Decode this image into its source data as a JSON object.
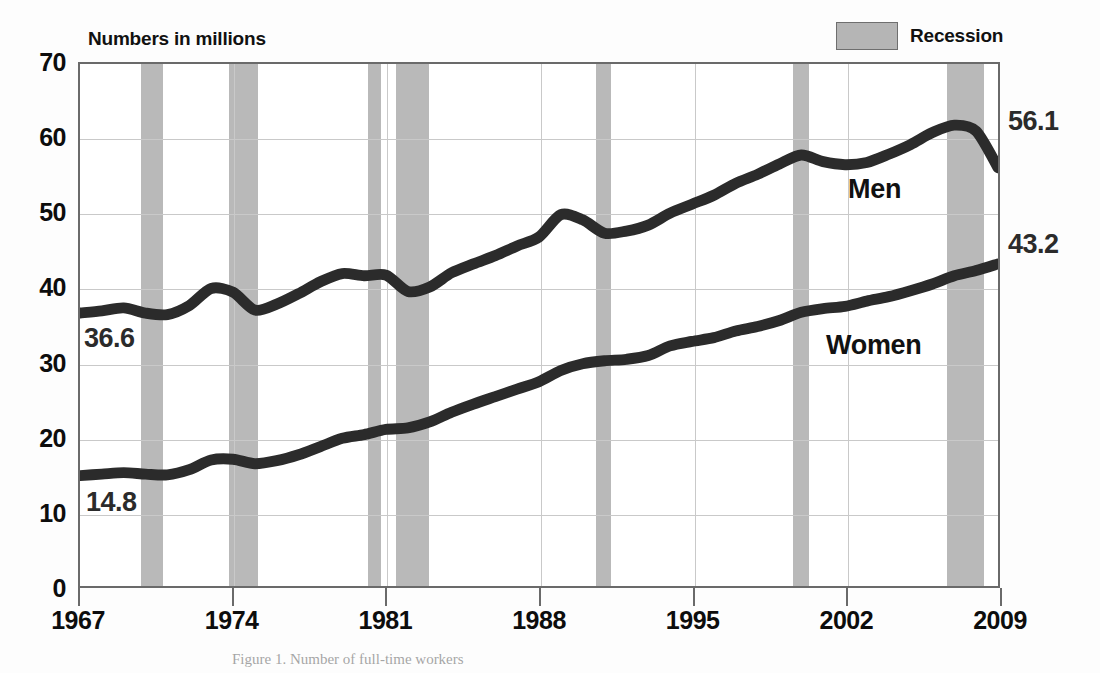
{
  "header": {
    "title": "Numbers in millions",
    "legend": {
      "label": "Recession",
      "swatch_color": "#b9b9b9",
      "swatch_icon": "recession-swatch-icon"
    }
  },
  "caption": "Figure 1. Number of full-time workers",
  "annotations": {
    "men_label": "Men",
    "women_label": "Women",
    "men_start_value": "36.6",
    "men_end_value": "56.1",
    "women_start_value": "14.8",
    "women_end_value": "43.2"
  },
  "chart_data": {
    "type": "line",
    "title": "Numbers in millions",
    "xlabel": "",
    "ylabel": "Numbers in millions",
    "xlim": [
      1967,
      2009
    ],
    "ylim": [
      0,
      70
    ],
    "ytick_labels": [
      "0",
      "10",
      "20",
      "30",
      "40",
      "50",
      "60",
      "70"
    ],
    "yticks": [
      0,
      10,
      20,
      30,
      40,
      50,
      60,
      70
    ],
    "xtick_labels": [
      "1967",
      "1974",
      "1981",
      "1988",
      "1995",
      "2002",
      "2009"
    ],
    "xticks": [
      1967,
      1974,
      1981,
      1988,
      1995,
      2002,
      2009
    ],
    "grid": true,
    "legend_position": "top-right",
    "line_color": "#2b2b2b",
    "recession_color": "#b9b9b9",
    "x": [
      1967,
      1968,
      1969,
      1970,
      1971,
      1972,
      1973,
      1974,
      1975,
      1976,
      1977,
      1978,
      1979,
      1980,
      1981,
      1982,
      1983,
      1984,
      1985,
      1986,
      1987,
      1988,
      1989,
      1990,
      1991,
      1992,
      1993,
      1994,
      1995,
      1996,
      1997,
      1998,
      1999,
      2000,
      2001,
      2002,
      2003,
      2004,
      2005,
      2006,
      2007,
      2008,
      2009
    ],
    "series": [
      {
        "name": "Men",
        "values": [
          36.6,
          36.9,
          37.3,
          36.6,
          36.4,
          37.6,
          39.9,
          39.4,
          37.0,
          37.8,
          39.2,
          40.8,
          41.9,
          41.6,
          41.7,
          39.5,
          40.1,
          42.0,
          43.2,
          44.3,
          45.6,
          46.8,
          49.8,
          49.1,
          47.3,
          47.6,
          48.4,
          50.0,
          51.2,
          52.4,
          54.0,
          55.2,
          56.6,
          57.8,
          56.9,
          56.5,
          56.8,
          57.9,
          59.2,
          60.8,
          61.8,
          61.0,
          56.1
        ],
        "start_label": "36.6",
        "end_label": "56.1"
      },
      {
        "name": "Women",
        "values": [
          14.8,
          15.0,
          15.2,
          15.0,
          14.9,
          15.6,
          16.9,
          17.0,
          16.4,
          16.8,
          17.6,
          18.7,
          19.8,
          20.3,
          21.0,
          21.2,
          22.0,
          23.3,
          24.4,
          25.4,
          26.4,
          27.4,
          28.9,
          29.8,
          30.2,
          30.4,
          30.9,
          32.2,
          32.8,
          33.3,
          34.2,
          34.8,
          35.6,
          36.7,
          37.2,
          37.5,
          38.2,
          38.8,
          39.6,
          40.5,
          41.6,
          42.3,
          43.2
        ],
        "start_label": "14.8",
        "end_label": "43.2"
      }
    ],
    "recession_bands": [
      {
        "start": 1969.8,
        "end": 1970.8
      },
      {
        "start": 1973.8,
        "end": 1975.1
      },
      {
        "start": 1980.1,
        "end": 1980.7
      },
      {
        "start": 1981.4,
        "end": 1982.9
      },
      {
        "start": 1990.5,
        "end": 1991.2
      },
      {
        "start": 1999.5,
        "end": 2000.2
      },
      {
        "start": 2006.5,
        "end": 2008.2
      }
    ]
  }
}
